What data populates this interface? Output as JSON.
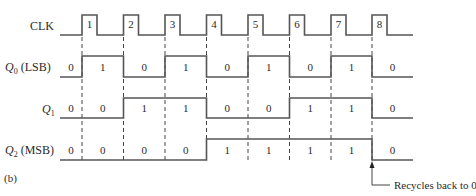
{
  "figure_label": "(b)",
  "annotation": "Recycles back to 0",
  "signals": [
    {
      "name": "CLK",
      "sub": "",
      "suffix": "",
      "id": "clk"
    },
    {
      "name": "Q",
      "sub": "0",
      "suffix": " (LSB)",
      "id": "q0",
      "values": [
        "0",
        "1",
        "0",
        "1",
        "0",
        "1",
        "0",
        "1",
        "0"
      ]
    },
    {
      "name": "Q",
      "sub": "1",
      "suffix": "",
      "id": "q1",
      "values": [
        "0",
        "0",
        "1",
        "1",
        "0",
        "0",
        "1",
        "1",
        "0"
      ]
    },
    {
      "name": "Q",
      "sub": "2",
      "suffix": " (MSB)",
      "id": "q2",
      "values": [
        "0",
        "0",
        "0",
        "0",
        "1",
        "1",
        "1",
        "1",
        "0"
      ]
    }
  ],
  "clock_pulses": [
    "1",
    "2",
    "3",
    "4",
    "5",
    "6",
    "7",
    "8"
  ],
  "colors": {
    "line": "#555555",
    "text": "#2a2a2a",
    "background": "#ffffff"
  }
}
